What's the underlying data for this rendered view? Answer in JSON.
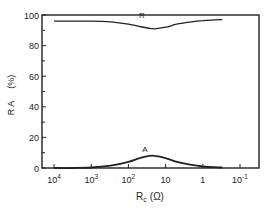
{
  "chart_data": {
    "type": "line",
    "title": "",
    "xlabel": "R_c (Ω)",
    "xlabel_main": "R",
    "xlabel_sub": "c",
    "xlabel_unit": "(Ω)",
    "ylabel": "R  A   (%)",
    "ylabel_letters": "R A",
    "ylabel_unit": "(%)",
    "xscale": "log-reversed",
    "xlim": [
      20000,
      0.05
    ],
    "ylim": [
      0,
      100
    ],
    "grid": false,
    "legend": "none (curves labeled inline)",
    "x_ticks": [
      {
        "value": 10000,
        "base": "10",
        "exp": "4"
      },
      {
        "value": 1000,
        "base": "10",
        "exp": "3"
      },
      {
        "value": 100,
        "base": "10",
        "exp": "2"
      },
      {
        "value": 10,
        "base": "10",
        "exp": ""
      },
      {
        "value": 1,
        "base": "1",
        "exp": ""
      },
      {
        "value": 0.1,
        "base": "10",
        "exp": "-1"
      }
    ],
    "y_ticks": [
      "0",
      "20",
      "40",
      "60",
      "80",
      "100"
    ],
    "series": [
      {
        "name": "R",
        "label": "R",
        "x": [
          10000,
          3000,
          1000,
          300,
          100,
          50,
          30,
          20,
          10,
          5,
          2,
          1,
          0.5,
          0.3
        ],
        "values": [
          96,
          96,
          96,
          95.5,
          94,
          92.5,
          91.5,
          91,
          92,
          94,
          95.5,
          96.3,
          96.8,
          97
        ]
      },
      {
        "name": "A",
        "label": "A",
        "x": [
          10000,
          3000,
          1000,
          300,
          100,
          50,
          30,
          20,
          10,
          5,
          2,
          1,
          0.5,
          0.3
        ],
        "values": [
          0,
          0,
          0.3,
          1.5,
          4,
          6.5,
          7.8,
          8,
          6.5,
          4,
          2,
          1,
          0.5,
          0.3
        ]
      }
    ]
  }
}
